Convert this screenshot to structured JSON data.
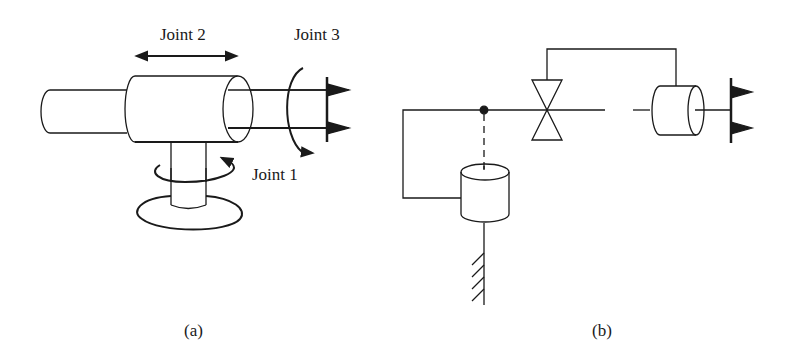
{
  "figure_a": {
    "caption": "(a)",
    "labels": {
      "joint1": "Joint 1",
      "joint2": "Joint 2",
      "joint3": "Joint 3"
    }
  },
  "figure_b": {
    "caption": "(b)"
  },
  "colors": {
    "stroke": "#1a1a1a",
    "background": "#ffffff"
  }
}
